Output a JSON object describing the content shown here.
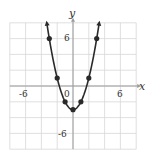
{
  "chart_data": {
    "type": "line",
    "title": "",
    "xlabel": "x",
    "ylabel": "y",
    "xlim": [
      -8,
      8
    ],
    "ylim": [
      -8,
      8
    ],
    "grid": true,
    "grid_step": 2,
    "tick_labels": {
      "x": [
        {
          "value": -6,
          "label": "-6"
        },
        {
          "value": 6,
          "label": "6"
        }
      ],
      "y": [
        {
          "value": 6,
          "label": "6"
        },
        {
          "value": -6,
          "label": "-6"
        }
      ],
      "origin": "0"
    },
    "series": [
      {
        "name": "y = x^2 - 3",
        "equation": "y = x^2 - 3",
        "points": [
          [
            -3,
            6
          ],
          [
            -2,
            1
          ],
          [
            -1,
            -2
          ],
          [
            0,
            -3
          ],
          [
            1,
            -2
          ],
          [
            2,
            1
          ],
          [
            3,
            6
          ]
        ],
        "arrows_at_ends": true
      }
    ],
    "colors": {
      "curve": "#2a2a2a",
      "grid": "#d8d8d8",
      "axis": "#9a9a9a",
      "points": "#2a2a2a"
    }
  },
  "labels": {
    "x_axis": "x",
    "y_axis": "y",
    "x_neg": "-6",
    "x_pos": "6",
    "y_pos": "6",
    "y_neg": "-6",
    "origin": "0"
  }
}
